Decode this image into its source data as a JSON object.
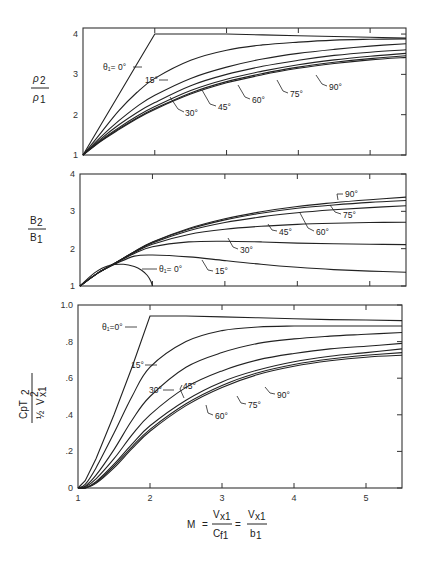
{
  "chart_data": [
    {
      "type": "line",
      "panel": "top",
      "ylabel_num": "ρ2",
      "ylabel_den": "ρ1",
      "xlim": [
        1,
        5.5
      ],
      "ylim": [
        1,
        4.3
      ],
      "yticks": [
        1,
        2,
        3,
        4
      ],
      "ytick_labels": [
        "1",
        "2",
        "3",
        "4"
      ],
      "grid": false,
      "x": [
        1,
        1.25,
        1.5,
        1.75,
        2,
        2.5,
        3,
        3.5,
        4,
        4.5,
        5,
        5.5
      ],
      "series": [
        {
          "name": "θ1=0°",
          "values": [
            1,
            1.75,
            2.5,
            3.25,
            4.0,
            4.0,
            4.0,
            3.98,
            3.96,
            3.94,
            3.92,
            3.9
          ]
        },
        {
          "name": "15°",
          "values": [
            1,
            1.55,
            2.1,
            2.55,
            2.9,
            3.35,
            3.6,
            3.73,
            3.8,
            3.85,
            3.87,
            3.88
          ]
        },
        {
          "name": "30°",
          "values": [
            1,
            1.45,
            1.85,
            2.2,
            2.48,
            2.9,
            3.18,
            3.38,
            3.52,
            3.62,
            3.7,
            3.76
          ]
        },
        {
          "name": "45°",
          "values": [
            1,
            1.4,
            1.75,
            2.05,
            2.3,
            2.72,
            3.0,
            3.2,
            3.35,
            3.47,
            3.55,
            3.61
          ]
        },
        {
          "name": "60°",
          "values": [
            1,
            1.37,
            1.68,
            1.96,
            2.2,
            2.6,
            2.88,
            3.08,
            3.24,
            3.36,
            3.45,
            3.52
          ]
        },
        {
          "name": "75°",
          "values": [
            1,
            1.35,
            1.65,
            1.92,
            2.15,
            2.54,
            2.82,
            3.02,
            3.18,
            3.3,
            3.39,
            3.46
          ]
        },
        {
          "name": "90°",
          "values": [
            1,
            1.34,
            1.63,
            1.9,
            2.13,
            2.51,
            2.79,
            2.99,
            3.15,
            3.27,
            3.36,
            3.42
          ]
        }
      ],
      "annotations": [
        "θ1=0°",
        "15°",
        "30°",
        "45°",
        "60°",
        "75°",
        "90°"
      ]
    },
    {
      "type": "line",
      "panel": "middle",
      "ylabel_num": "B2",
      "ylabel_den": "B1",
      "xlim": [
        1,
        5.5
      ],
      "ylim": [
        1,
        4
      ],
      "yticks": [
        1,
        2,
        3,
        4
      ],
      "ytick_labels": [
        "1",
        "2",
        "3",
        "4"
      ],
      "grid": false,
      "x": [
        1,
        1.25,
        1.5,
        1.75,
        2,
        2.5,
        3,
        3.5,
        4,
        4.5,
        5,
        5.5
      ],
      "series": [
        {
          "name": "θ1=0°",
          "x": [
            1,
            1.2,
            1.4,
            1.6,
            1.75,
            1.85,
            1.93,
            1.98,
            2.0
          ],
          "values": [
            1,
            1.35,
            1.55,
            1.58,
            1.52,
            1.42,
            1.28,
            1.12,
            1.0
          ]
        },
        {
          "name": "15°",
          "values": [
            1,
            1.35,
            1.6,
            1.8,
            1.83,
            1.78,
            1.68,
            1.58,
            1.5,
            1.44,
            1.4,
            1.37
          ]
        },
        {
          "name": "30°",
          "values": [
            1,
            1.35,
            1.62,
            1.87,
            2.05,
            2.18,
            2.2,
            2.18,
            2.15,
            2.13,
            2.12,
            2.11
          ]
        },
        {
          "name": "45°",
          "values": [
            1,
            1.35,
            1.63,
            1.9,
            2.12,
            2.38,
            2.52,
            2.6,
            2.65,
            2.68,
            2.7,
            2.71
          ]
        },
        {
          "name": "60°",
          "values": [
            1,
            1.35,
            1.63,
            1.91,
            2.15,
            2.48,
            2.7,
            2.85,
            2.96,
            3.04,
            3.1,
            3.15
          ]
        },
        {
          "name": "75°",
          "values": [
            1,
            1.35,
            1.63,
            1.92,
            2.17,
            2.52,
            2.77,
            2.95,
            3.08,
            3.17,
            3.24,
            3.29
          ]
        },
        {
          "name": "90°",
          "values": [
            1,
            1.35,
            1.63,
            1.92,
            2.18,
            2.54,
            2.8,
            2.99,
            3.13,
            3.23,
            3.31,
            3.38
          ]
        }
      ],
      "annotations": [
        "θ1=0°",
        "15°",
        "30°",
        "45°",
        "60°",
        "75°",
        "90°"
      ]
    },
    {
      "type": "line",
      "panel": "bottom",
      "ylabel_num": "CpT2",
      "ylabel_den": "½ V²x1",
      "xlabel": "M = Vx1 / Cf1 = Vx1 / b1",
      "xlim": [
        1,
        5.5
      ],
      "ylim": [
        0,
        1.0
      ],
      "xticks": [
        1,
        2,
        3,
        4,
        5
      ],
      "xtick_labels": [
        "1",
        "2",
        "3",
        "4",
        "5"
      ],
      "yticks": [
        0,
        0.2,
        0.4,
        0.6,
        0.8,
        1.0
      ],
      "ytick_labels": [
        "0",
        ".2",
        ".4",
        ".6",
        ".8",
        "1.0"
      ],
      "grid": false,
      "x": [
        1,
        1.1,
        1.25,
        1.5,
        1.75,
        2,
        2.5,
        3,
        3.5,
        4,
        4.5,
        5,
        5.5
      ],
      "series": [
        {
          "name": "θ1=0°",
          "values": [
            0,
            0.04,
            0.16,
            0.4,
            0.66,
            0.94,
            0.94,
            0.935,
            0.93,
            0.925,
            0.92,
            0.918,
            0.915
          ]
        },
        {
          "name": "15°",
          "values": [
            0,
            0.02,
            0.11,
            0.3,
            0.5,
            0.66,
            0.8,
            0.86,
            0.88,
            0.885,
            0.885,
            0.885,
            0.885
          ]
        },
        {
          "name": "30°",
          "values": [
            0,
            0.01,
            0.07,
            0.21,
            0.37,
            0.5,
            0.66,
            0.74,
            0.79,
            0.815,
            0.83,
            0.84,
            0.85
          ]
        },
        {
          "name": "45°",
          "values": [
            0,
            0.005,
            0.05,
            0.16,
            0.29,
            0.4,
            0.55,
            0.64,
            0.7,
            0.735,
            0.76,
            0.775,
            0.79
          ]
        },
        {
          "name": "60°",
          "values": [
            0,
            0,
            0.035,
            0.13,
            0.24,
            0.34,
            0.48,
            0.58,
            0.645,
            0.69,
            0.72,
            0.74,
            0.76
          ]
        },
        {
          "name": "75°",
          "values": [
            0,
            0,
            0.03,
            0.12,
            0.225,
            0.32,
            0.46,
            0.56,
            0.63,
            0.675,
            0.705,
            0.725,
            0.74
          ]
        },
        {
          "name": "90°",
          "values": [
            0,
            0,
            0.025,
            0.11,
            0.215,
            0.31,
            0.45,
            0.55,
            0.62,
            0.665,
            0.695,
            0.715,
            0.725
          ]
        }
      ],
      "annotations": [
        "θ1=0°",
        "15°",
        "30°",
        "45°",
        "60°",
        "75°",
        "90°"
      ]
    }
  ],
  "labels": {
    "top": {
      "ylabel_num": "ρ",
      "ylabel_num_sub": "2",
      "ylabel_den": "ρ",
      "ylabel_den_sub": "1",
      "theta0": "θ₁= 0°",
      "a15": "15°",
      "a30": "30°",
      "a45": "45°",
      "a60": "60°",
      "a75": "75°",
      "a90": "90°"
    },
    "middle": {
      "ylabel_num": "B",
      "ylabel_num_sub": "2",
      "ylabel_den": "B",
      "ylabel_den_sub": "1",
      "theta0": "θ₁= 0°",
      "a15": "15°",
      "a30": "30°",
      "a45": "45°",
      "a60": "60°",
      "a75": "75°",
      "a90": "90°"
    },
    "bottom": {
      "ylabel_num": "CpT",
      "ylabel_num_sub": "2",
      "ylabel_den_half": "½",
      "ylabel_den": "V",
      "ylabel_den_sup": "2",
      "ylabel_den_sub": "x1",
      "theta0": "θ₁=0°",
      "a15": "15°",
      "a30": "30°",
      "a45": "45°",
      "a60": "60°",
      "a75": "75°",
      "a90": "90°"
    },
    "xaxis": {
      "M": "M",
      "eq1": "=",
      "num1": "V",
      "num1_sub": "x1",
      "den1": "C",
      "den1_sub": "f1",
      "eq2": "=",
      "num2": "V",
      "num2_sub": "x1",
      "den2": "b",
      "den2_sub": "1"
    }
  }
}
